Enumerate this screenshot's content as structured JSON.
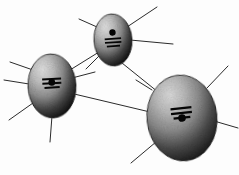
{
  "figure": {
    "title": "Three-node shaded ellipse network diagram",
    "background_color": "#fdfdfd",
    "width": 239,
    "height": 175,
    "style": "halftone-scanned-grayscale"
  },
  "palette": {
    "node_light": "#d8d8d8",
    "node_mid": "#8a8a8a",
    "node_dark": "#1a1a1a",
    "node_outline": "#111111",
    "edge_color": "#2b2b2b",
    "glyph_color": "#050505",
    "paper": "#fdfdfd"
  },
  "nodes": [
    {
      "id": "node-top",
      "label": "top-node",
      "cx": 113,
      "cy": 40,
      "rx": 19,
      "ry": 26,
      "rotation": -4,
      "glyph": "atom-glyph",
      "glyph_orientation": "dot-above-bars",
      "size_rank": "small"
    },
    {
      "id": "node-left",
      "label": "left-node",
      "cx": 52,
      "cy": 86,
      "rx": 24,
      "ry": 32,
      "rotation": -3,
      "glyph": "atom-glyph",
      "glyph_orientation": "dot-centered-on-bars",
      "size_rank": "medium"
    },
    {
      "id": "node-right",
      "label": "right-node",
      "cx": 182,
      "cy": 118,
      "rx": 35,
      "ry": 43,
      "rotation": -6,
      "glyph": "atom-glyph",
      "glyph_orientation": "dot-below-bars",
      "size_rank": "large"
    }
  ],
  "edges": [
    {
      "id": "edge-left-top",
      "label": "left-to-top-edge",
      "from": "node-left",
      "to": "node-top",
      "x1": 70,
      "y1": 70,
      "x2": 99,
      "y2": 52
    },
    {
      "id": "edge-top-right",
      "label": "top-to-right-edge",
      "from": "node-top",
      "to": "node-right",
      "x1": 122,
      "y1": 63,
      "x2": 158,
      "y2": 92
    },
    {
      "id": "edge-left-right",
      "label": "left-to-right-edge",
      "from": "node-left",
      "to": "node-right",
      "x1": 70,
      "y1": 93,
      "x2": 150,
      "y2": 112
    }
  ],
  "radiating_lines": [
    {
      "id": "ray-top-1",
      "label": "top-node-ray-upper-right",
      "x1": 127,
      "y1": 27,
      "x2": 157,
      "y2": 7
    },
    {
      "id": "ray-top-2",
      "label": "top-node-ray-right",
      "x1": 130,
      "y1": 40,
      "x2": 173,
      "y2": 44
    },
    {
      "id": "ray-top-3",
      "label": "top-node-ray-upper-left",
      "x1": 97,
      "y1": 27,
      "x2": 79,
      "y2": 19
    },
    {
      "id": "ray-top-4",
      "label": "top-node-ray-lower-left",
      "x1": 99,
      "y1": 56,
      "x2": 86,
      "y2": 69
    },
    {
      "id": "ray-left-1",
      "label": "left-node-ray-upper-left",
      "x1": 33,
      "y1": 70,
      "x2": 10,
      "y2": 62
    },
    {
      "id": "ray-left-2",
      "label": "left-node-ray-left",
      "x1": 29,
      "y1": 84,
      "x2": 4,
      "y2": 80
    },
    {
      "id": "ray-left-3",
      "label": "left-node-ray-lower-left",
      "x1": 33,
      "y1": 103,
      "x2": 9,
      "y2": 120
    },
    {
      "id": "ray-left-4",
      "label": "left-node-ray-right",
      "x1": 72,
      "y1": 78,
      "x2": 95,
      "y2": 72
    },
    {
      "id": "ray-left-5",
      "label": "left-node-ray-down",
      "x1": 52,
      "y1": 116,
      "x2": 50,
      "y2": 142
    },
    {
      "id": "ray-right-1",
      "label": "right-node-ray-upper-right",
      "x1": 207,
      "y1": 88,
      "x2": 228,
      "y2": 66
    },
    {
      "id": "ray-right-2",
      "label": "right-node-ray-right",
      "x1": 214,
      "y1": 121,
      "x2": 238,
      "y2": 128
    },
    {
      "id": "ray-right-3",
      "label": "right-node-ray-upper-left",
      "x1": 152,
      "y1": 90,
      "x2": 136,
      "y2": 80
    },
    {
      "id": "ray-right-4",
      "label": "right-node-ray-lower-left",
      "x1": 156,
      "y1": 142,
      "x2": 131,
      "y2": 163
    },
    {
      "id": "ray-right-5",
      "label": "right-node-ray-inner",
      "x1": 173,
      "y1": 128,
      "x2": 196,
      "y2": 120
    }
  ],
  "glyph_spec": {
    "name": "atom-glyph",
    "bars": 3,
    "bar_widths": [
      20,
      20,
      16
    ],
    "dot_radius": 3.2,
    "description": "Stacked horizontal bars with a small filled circle, resembling a simplified atom or equals-sign marker"
  }
}
